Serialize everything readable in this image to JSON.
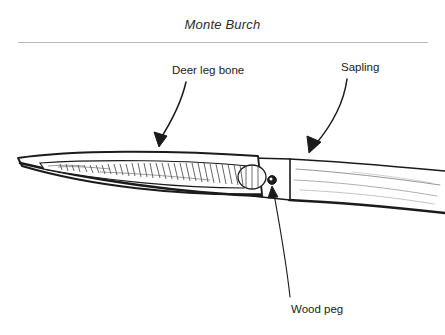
{
  "page": {
    "background_color": "#ffffff",
    "ink_color": "#1b1b1b",
    "rule_color": "#b9b9b9"
  },
  "header": {
    "title": "Monte Burch",
    "rule_name": "horizontal-rule"
  },
  "figure": {
    "parts": [
      {
        "id": "deer-leg-bone",
        "label": "Deer leg bone",
        "label_x": 172,
        "label_y": 64,
        "arrow": "curved-arrow-down-left"
      },
      {
        "id": "sapling",
        "label": "Sapling",
        "label_x": 341,
        "label_y": 61,
        "arrow": "curved-arrow-down-left"
      },
      {
        "id": "wood-peg",
        "label": "Wood peg",
        "label_x": 291,
        "label_y": 303,
        "arrow": "straight-leader-line-up"
      }
    ]
  }
}
